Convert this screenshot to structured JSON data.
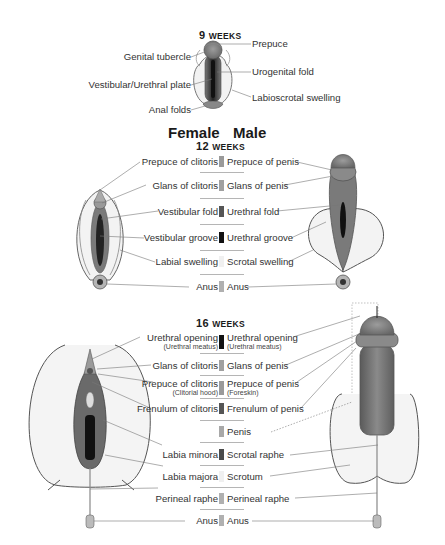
{
  "week9": {
    "title_num": "9",
    "title_word": "WEEKS",
    "labels_left": [
      "Genital tubercle",
      "Vestibular/Urethral plate",
      "Anal folds"
    ],
    "labels_right": [
      "Prepuce",
      "Urogenital fold",
      "Labioscrotal swelling"
    ]
  },
  "headers": {
    "female": "Female",
    "male": "Male"
  },
  "week12": {
    "title_num": "12",
    "title_word": "WEEKS",
    "rows": [
      {
        "female": "Prepuce of clitoris",
        "male": "Prepuce of penis",
        "swatch": "#9a9a9a"
      },
      {
        "female": "Glans of clitoris",
        "male": "Glans of penis",
        "swatch": "#a0a0a0"
      },
      {
        "female": "Vestibular fold",
        "male": "Urethral fold",
        "swatch": "#555555"
      },
      {
        "female": "Vestibular groove",
        "male": "Urethral groove",
        "swatch": "#111111"
      },
      {
        "female": "Labial swelling",
        "male": "Scrotal swelling",
        "swatch": "#f0f0f0"
      },
      {
        "female": "Anus",
        "male": "Anus",
        "swatch": "#b0b0b0"
      }
    ]
  },
  "week16": {
    "title_num": "16",
    "title_word": "WEEKS",
    "rows": [
      {
        "female": "Urethral opening",
        "female_sub": "(Urethral meatus)",
        "male": "Urethral opening",
        "male_sub": "(Urethral meatus)",
        "swatch": "#111111"
      },
      {
        "female": "Glans of clitoris",
        "male": "Glans of penis",
        "swatch": "#a0a0a0"
      },
      {
        "female": "Prepuce of clitoris",
        "female_sub": "(Clitorial hood)",
        "male": "Prepuce of penis",
        "male_sub": "(Foreskin)",
        "swatch": "#9a9a9a"
      },
      {
        "female": "Frenulum of clitoris",
        "male": "Frenulum of penis",
        "swatch": "#555555"
      },
      {
        "female": "",
        "male": "Penis",
        "swatch": "#a8a8a8"
      },
      {
        "female": "Labia minora",
        "male": "Scrotal raphe",
        "swatch": "#4a4a4a"
      },
      {
        "female": "Labia majora",
        "male": "Scrotum",
        "swatch": "#f0f0f0"
      },
      {
        "female": "Perineal raphe",
        "male": "Perineal raphe",
        "swatch": "#b0b0b0"
      },
      {
        "female": "Anus",
        "male": "Anus",
        "swatch": "#b0b0b0"
      }
    ]
  }
}
